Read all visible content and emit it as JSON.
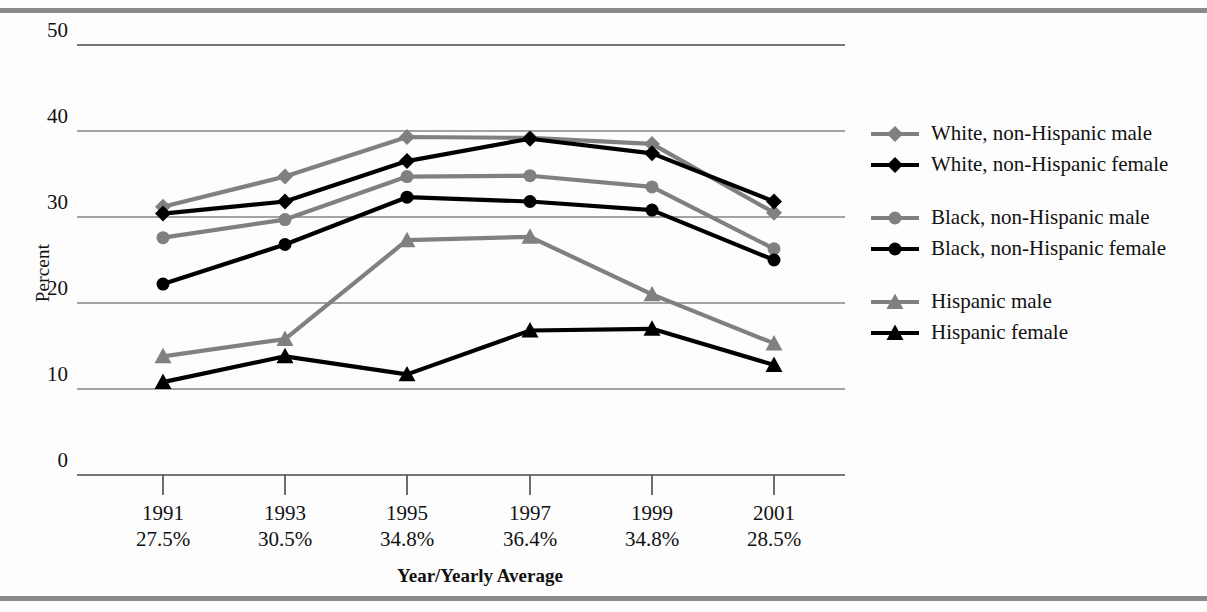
{
  "axes": {
    "ylabel": "Percent",
    "xlabel": "Year/Yearly Average",
    "yticks": [
      "0",
      "10",
      "20",
      "30",
      "40",
      "50"
    ]
  },
  "xaxis_entries": [
    {
      "year": "1991",
      "average": "27.5%"
    },
    {
      "year": "1993",
      "average": "30.5%"
    },
    {
      "year": "1995",
      "average": "34.8%"
    },
    {
      "year": "1997",
      "average": "36.4%"
    },
    {
      "year": "1999",
      "average": "34.8%"
    },
    {
      "year": "2001",
      "average": "28.5%"
    }
  ],
  "legend": {
    "groups": [
      {
        "items": [
          {
            "label": "White, non-Hispanic male",
            "marker": "diamond-marker",
            "color": "#808080"
          },
          {
            "label": "White, non-Hispanic female",
            "marker": "diamond-marker",
            "color": "#000000"
          }
        ]
      },
      {
        "items": [
          {
            "label": "Black, non-Hispanic male",
            "marker": "circle-marker",
            "color": "#808080"
          },
          {
            "label": "Black, non-Hispanic female",
            "marker": "circle-marker",
            "color": "#000000"
          }
        ]
      },
      {
        "items": [
          {
            "label": "Hispanic male",
            "marker": "triangle-marker",
            "color": "#808080"
          },
          {
            "label": "Hispanic female",
            "marker": "triangle-marker",
            "color": "#000000"
          }
        ]
      }
    ]
  },
  "colors": {
    "male_gray": "#808080",
    "female_black": "#000000",
    "gridline": "#4a4a4a",
    "page_rule": "#8a8a8a"
  },
  "chart_data": {
    "type": "line",
    "title": "",
    "xlabel": "Year/Yearly Average",
    "ylabel": "Percent",
    "categories": [
      "1991",
      "1993",
      "1995",
      "1997",
      "1999",
      "2001"
    ],
    "category_sublabels": [
      "27.5%",
      "30.5%",
      "34.8%",
      "36.4%",
      "34.8%",
      "28.5%"
    ],
    "ylim": [
      0,
      50
    ],
    "yticks": [
      0,
      10,
      20,
      30,
      40,
      50
    ],
    "grid": true,
    "legend_position": "right",
    "series": [
      {
        "name": "White, non-Hispanic male",
        "marker": "diamond",
        "color": "#808080",
        "values": [
          31.2,
          34.7,
          39.3,
          39.2,
          38.5,
          30.5
        ]
      },
      {
        "name": "White, non-Hispanic female",
        "marker": "diamond",
        "color": "#000000",
        "values": [
          30.4,
          31.8,
          36.5,
          39.1,
          37.4,
          31.8
        ]
      },
      {
        "name": "Black, non-Hispanic male",
        "marker": "circle",
        "color": "#808080",
        "values": [
          27.6,
          29.7,
          34.7,
          34.8,
          33.5,
          26.3
        ]
      },
      {
        "name": "Black, non-Hispanic female",
        "marker": "circle",
        "color": "#000000",
        "values": [
          22.2,
          26.8,
          32.3,
          31.8,
          30.8,
          25.0
        ]
      },
      {
        "name": "Hispanic male",
        "marker": "triangle",
        "color": "#808080",
        "values": [
          13.8,
          15.8,
          27.3,
          27.7,
          21.0,
          15.3
        ]
      },
      {
        "name": "Hispanic female",
        "marker": "triangle",
        "color": "#000000",
        "values": [
          10.8,
          13.8,
          11.7,
          16.8,
          17.0,
          12.8
        ]
      }
    ]
  }
}
